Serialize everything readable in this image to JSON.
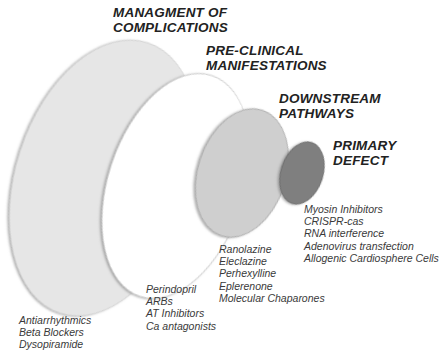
{
  "stages": [
    {
      "id": "complications",
      "title_lines": [
        "MANAGMENT OF",
        "COMPLICATIONS"
      ],
      "fill": "#e6e6e6",
      "items": [
        "Antiarrhythmics",
        "Beta Blockers",
        "Dysopiramide"
      ]
    },
    {
      "id": "pre-clinical",
      "title_lines": [
        "PRE-CLINICAL",
        "MANIFESTATIONS"
      ],
      "fill": "#ffffff",
      "items": [
        "Perindopril",
        "ARBs",
        "AT Inhibitors",
        "Ca antagonists"
      ]
    },
    {
      "id": "downstream",
      "title_lines": [
        "DOWNSTREAM",
        "PATHWAYS"
      ],
      "fill": "#cfcfcf",
      "items": [
        "Ranolazine",
        "Eleclazine",
        "Perhexylline",
        "Eplerenone",
        "Molecular Chaparones"
      ]
    },
    {
      "id": "primary",
      "title_lines": [
        "PRIMARY",
        "DEFECT"
      ],
      "fill": "#7f7f7f",
      "items": [
        "Myosin Inhibitors",
        "CRISPR-cas",
        "RNA interference",
        "Adenovirus transfection",
        "Allogenic Cardiosphere Cells"
      ]
    }
  ]
}
